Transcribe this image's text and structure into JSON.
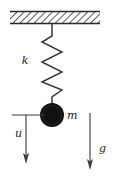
{
  "figure": {
    "type": "physics-free-body-diagram",
    "background_color": "#ffffff",
    "ink_color": "#1a1a1a",
    "width": 116,
    "height": 178
  },
  "ceiling": {
    "name": "fixed-support",
    "hatch_style": "diagonal",
    "hatch_color": "#555555",
    "border_color": "#2a2a2a",
    "x": 10,
    "y": 11,
    "width": 90,
    "height": 13
  },
  "spring": {
    "name": "spring",
    "label": "k",
    "label_x": 25,
    "label_y": 64,
    "color": "#3a3a3a",
    "top_x": 52,
    "top_y": 24,
    "bottom_y": 104,
    "coils": 5,
    "amplitude": 10
  },
  "mass": {
    "name": "mass-ball",
    "label": "m",
    "label_x": 67,
    "label_y": 119,
    "fill": "#111111",
    "center_x": 52,
    "center_y": 115,
    "radius": 12
  },
  "displacement_arrow": {
    "name": "displacement-u",
    "label": "u",
    "label_x": 15,
    "label_y": 137,
    "color": "#3a3a3a",
    "reference_line_x1": 12,
    "reference_line_x2": 45,
    "reference_line_y": 115,
    "arrow_x": 26,
    "arrow_y1": 115,
    "arrow_y2": 163,
    "direction": "down"
  },
  "gravity_arrow": {
    "name": "gravity-g",
    "label": "g",
    "label_x": 99,
    "label_y": 152,
    "color": "#3a3a3a",
    "arrow_x": 90,
    "arrow_y1": 113,
    "arrow_y2": 169,
    "direction": "down"
  }
}
